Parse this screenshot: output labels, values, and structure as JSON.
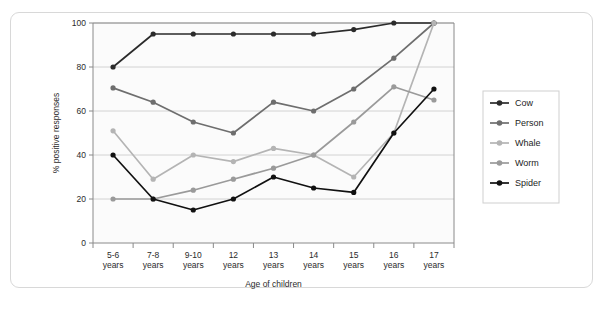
{
  "chart_data": {
    "type": "line",
    "title": "",
    "xlabel": "Age of children",
    "ylabel": "% positive responses",
    "categories": [
      "5-6\nyears",
      "7-8\nyears",
      "9-10\nyears",
      "12\nyears",
      "13\nyears",
      "14\nyears",
      "15\nyears",
      "16\nyears",
      "17\nyears"
    ],
    "category_lines": [
      [
        "5-6",
        "years"
      ],
      [
        "7-8",
        "years"
      ],
      [
        "9-10",
        "years"
      ],
      [
        "12",
        "years"
      ],
      [
        "13",
        "years"
      ],
      [
        "14",
        "years"
      ],
      [
        "15",
        "years"
      ],
      [
        "16",
        "years"
      ],
      [
        "17",
        "years"
      ]
    ],
    "ylim": [
      0,
      100
    ],
    "yticks": [
      0,
      20,
      40,
      60,
      80,
      100
    ],
    "ytick_labels": [
      "0",
      "20",
      "40",
      "60",
      "80",
      "100"
    ],
    "grid": true,
    "legend_position": "right",
    "series": [
      {
        "name": "Cow",
        "color": "#2b2b2b",
        "values": [
          80,
          95,
          95,
          95,
          95,
          95,
          97,
          100,
          100
        ]
      },
      {
        "name": "Person",
        "color": "#6e6e6e",
        "values": [
          70.5,
          64,
          55,
          50,
          64,
          60,
          70,
          84,
          100
        ]
      },
      {
        "name": "Whale",
        "color": "#b4b4b4",
        "values": [
          51,
          29,
          40,
          37,
          43,
          40,
          30,
          50,
          100
        ]
      },
      {
        "name": "Worm",
        "color": "#9a9a9a",
        "values": [
          20,
          20,
          24,
          29,
          34,
          40,
          55,
          71,
          65
        ]
      },
      {
        "name": "Spider",
        "color": "#111111",
        "values": [
          40,
          20,
          15,
          20,
          30,
          25,
          23,
          50,
          70
        ]
      }
    ]
  },
  "legend": {
    "items": [
      {
        "label": "Cow"
      },
      {
        "label": "Person"
      },
      {
        "label": "Whale"
      },
      {
        "label": "Worm"
      },
      {
        "label": "Spider"
      }
    ]
  }
}
